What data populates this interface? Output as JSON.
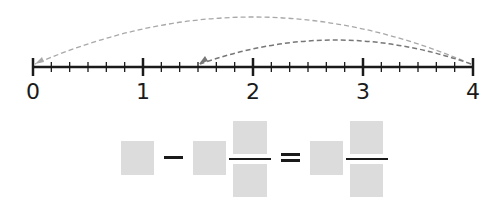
{
  "number_line": {
    "min": 0,
    "max": 4,
    "subdivisions_per_unit": 6,
    "labels": [
      "0",
      "1",
      "2",
      "3",
      "4"
    ],
    "axis_color": "#1a1a1a"
  },
  "jumps": [
    {
      "from": 4,
      "to": 0,
      "style": "dashed",
      "color": "#a8a8a8"
    },
    {
      "from": 4,
      "to": 1.5,
      "style": "dashed",
      "color": "#777777"
    }
  ],
  "equation": {
    "description": "[ ] − [ ] [ ]/[ ] = [ ] [ ]/[ ]",
    "operators": [
      "−",
      "="
    ],
    "box_color": "#dcdcdc",
    "boxes": {
      "term1_whole": "",
      "term2_whole": "",
      "term2_numerator": "",
      "term2_denominator": "",
      "result_whole": "",
      "result_numerator": "",
      "result_denominator": ""
    }
  }
}
